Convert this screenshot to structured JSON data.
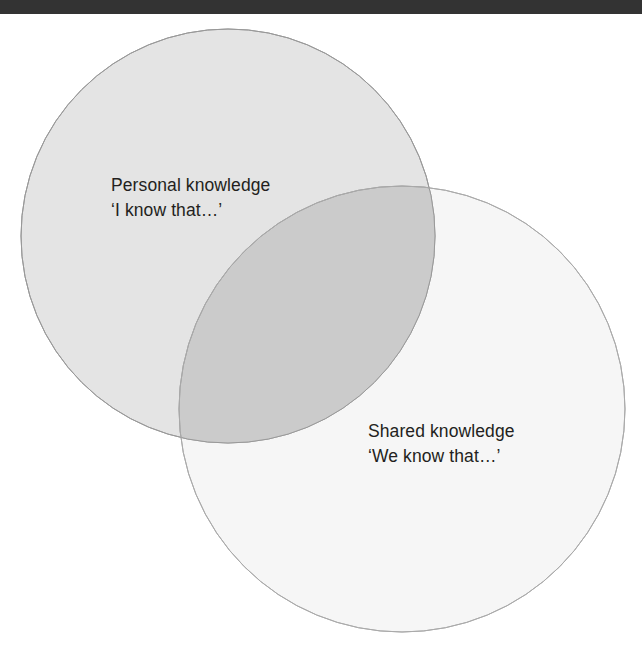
{
  "page": {
    "background_color": "#ffffff"
  },
  "top_bar": {
    "name": "page-header-band",
    "color": "#333333",
    "height": 14
  },
  "diagram": {
    "type": "venn",
    "sets": [
      {
        "id": "personal",
        "title": "Personal knowledge",
        "subtitle": "‘I know that…’",
        "fill_color": "#e4e4e4",
        "stroke_color": "#999999",
        "center_x": 228,
        "center_y": 236,
        "radius": 207
      },
      {
        "id": "shared",
        "title": "Shared knowledge",
        "subtitle": "‘We know that…’",
        "fill_color": "#f6f6f6",
        "stroke_color": "#aaaaaa",
        "center_x": 402,
        "center_y": 409,
        "radius": 223
      }
    ],
    "intersection": {
      "id": "personal-and-shared",
      "fill_color": "#cbcbcb",
      "label": ""
    },
    "text_color": "#231f20"
  },
  "chart_data": {
    "type": "venn",
    "title": "",
    "sets": [
      "Personal knowledge",
      "Shared knowledge"
    ],
    "set_labels": [
      "Personal knowledge ‘I know that…’",
      "Shared knowledge ‘We know that…’"
    ],
    "circles": [
      {
        "label": "Personal knowledge",
        "cx": 228,
        "cy": 236,
        "r": 207,
        "fill": "#e4e4e4"
      },
      {
        "label": "Shared knowledge",
        "cx": 402,
        "cy": 409,
        "r": 223,
        "fill": "#f6f6f6"
      }
    ],
    "overlap_fill": "#cbcbcb",
    "legend": "none",
    "grid": false
  }
}
